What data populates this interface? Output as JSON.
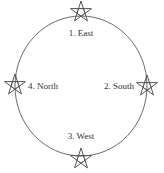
{
  "diagram": {
    "colors": {
      "line": "#6a6a6a",
      "star": "#555555",
      "text": "#333333"
    },
    "circle": {
      "cx": 81,
      "cy": 86,
      "rx": 66,
      "ry": 70
    },
    "points": [
      {
        "label": "1. East",
        "star": {
          "x": 81,
          "y": 12
        },
        "text": {
          "x": 81,
          "y": 36,
          "anchor": "middle"
        }
      },
      {
        "label": "2. South",
        "star": {
          "x": 147,
          "y": 86
        },
        "text": {
          "x": 134,
          "y": 89,
          "anchor": "end"
        }
      },
      {
        "label": "3. West",
        "star": {
          "x": 81,
          "y": 159
        },
        "text": {
          "x": 81,
          "y": 139,
          "anchor": "middle"
        }
      },
      {
        "label": "4. North",
        "star": {
          "x": 15,
          "y": 85
        },
        "text": {
          "x": 28,
          "y": 89,
          "anchor": "start"
        }
      }
    ]
  }
}
